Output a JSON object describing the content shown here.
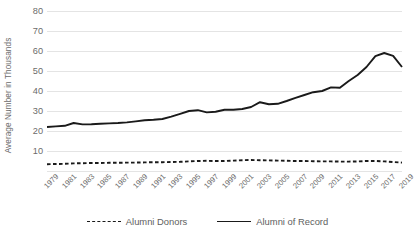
{
  "chart_data": {
    "type": "line",
    "title": "",
    "xlabel": "",
    "ylabel": "Average Number in Thousands",
    "ylim": [
      0,
      80
    ],
    "yticks": [
      0,
      10,
      20,
      30,
      40,
      50,
      60,
      70,
      80
    ],
    "ytick_labels": [
      "",
      "10",
      "20",
      "30",
      "40",
      "50",
      "60",
      "70",
      "80"
    ],
    "grid": true,
    "legend_position": "bottom",
    "x": [
      1979,
      1980,
      1981,
      1982,
      1983,
      1984,
      1985,
      1986,
      1987,
      1988,
      1989,
      1990,
      1991,
      1992,
      1993,
      1994,
      1995,
      1996,
      1997,
      1998,
      1999,
      2000,
      2001,
      2002,
      2003,
      2004,
      2005,
      2006,
      2007,
      2008,
      2009,
      2010,
      2011,
      2012,
      2013,
      2014,
      2015,
      2016,
      2017,
      2018,
      2019
    ],
    "xtick_labels": [
      "1979",
      "1981",
      "1983",
      "1985",
      "1987",
      "1989",
      "1991",
      "1993",
      "1995",
      "1997",
      "1999",
      "2001",
      "2003",
      "2005",
      "2007",
      "2009",
      "2011",
      "2013",
      "2015",
      "2017",
      "2019"
    ],
    "series": [
      {
        "name": "Alumni Donors",
        "style": "dashed",
        "color": "#1a1a1a",
        "values": [
          3.4,
          3.5,
          3.6,
          3.8,
          3.9,
          4.0,
          4.0,
          4.1,
          4.1,
          4.2,
          4.2,
          4.3,
          4.4,
          4.4,
          4.5,
          4.6,
          4.8,
          5.0,
          5.1,
          5.0,
          5.0,
          5.2,
          5.4,
          5.5,
          5.4,
          5.3,
          5.2,
          5.1,
          5.0,
          5.0,
          4.9,
          4.8,
          4.8,
          4.7,
          4.7,
          4.8,
          5.0,
          5.0,
          4.8,
          4.5,
          4.2
        ]
      },
      {
        "name": "Alumni of Record",
        "style": "solid",
        "color": "#1a1a1a",
        "values": [
          22.0,
          22.3,
          22.6,
          24.0,
          23.3,
          23.4,
          23.6,
          23.8,
          24.0,
          24.3,
          24.8,
          25.4,
          25.6,
          26.0,
          27.2,
          28.6,
          30.0,
          30.4,
          29.3,
          29.6,
          30.6,
          30.6,
          31.0,
          32.0,
          34.4,
          33.4,
          33.6,
          35.0,
          36.6,
          38.0,
          39.4,
          40.0,
          41.8,
          41.6,
          45.0,
          48.0,
          52.0,
          57.4,
          59.0,
          57.6,
          52.0
        ]
      }
    ]
  },
  "legend": {
    "items": [
      {
        "label": "Alumni Donors"
      },
      {
        "label": "Alumni of Record"
      }
    ]
  }
}
